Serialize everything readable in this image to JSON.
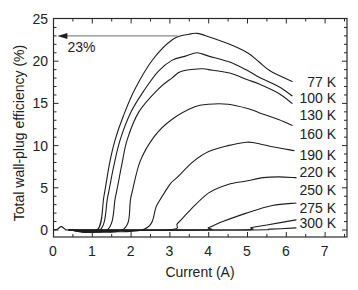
{
  "chart_data": {
    "type": "line",
    "title": "",
    "xlabel": "Current (A)",
    "ylabel": "Total wall-plug efficiency (%)",
    "xlim": [
      0,
      7.58
    ],
    "ylim": [
      -0.8,
      25
    ],
    "xticks": [
      0,
      1,
      2,
      3,
      4,
      5,
      6,
      7
    ],
    "xminor_step": 0.5,
    "yticks": [
      0,
      5,
      10,
      15,
      20,
      25
    ],
    "yminor_step": 1,
    "grid": false,
    "legend": "inline labels at right end of curves",
    "colors": {
      "line": "#1e1e1e",
      "arrow": "#8a8a8a",
      "frame": "#2a2a2a"
    },
    "series": [
      {
        "name": "77 K",
        "label_y": 17.5,
        "points": [
          [
            0.0,
            0
          ],
          [
            0.1,
            0.1
          ],
          [
            0.2,
            0.4
          ],
          [
            0.3,
            0.1
          ],
          [
            0.4,
            0
          ],
          [
            1.13,
            0
          ],
          [
            1.3,
            4.0
          ],
          [
            1.45,
            8.0
          ],
          [
            1.59,
            10.7
          ],
          [
            1.8,
            13.5
          ],
          [
            2.1,
            16.7
          ],
          [
            2.56,
            20.2
          ],
          [
            3.08,
            22.6
          ],
          [
            3.5,
            23.2
          ],
          [
            3.7,
            23.3
          ],
          [
            4.0,
            22.9
          ],
          [
            4.54,
            22.0
          ],
          [
            5.0,
            21.0
          ],
          [
            5.3,
            19.9
          ],
          [
            5.6,
            18.8
          ],
          [
            6.15,
            17.6
          ]
        ]
      },
      {
        "name": "100 K",
        "label_y": 15.6,
        "points": [
          [
            0.4,
            0
          ],
          [
            1.2,
            0
          ],
          [
            1.4,
            4.0
          ],
          [
            1.55,
            7.5
          ],
          [
            1.72,
            10.7
          ],
          [
            2.0,
            14.0
          ],
          [
            2.36,
            16.7
          ],
          [
            2.7,
            18.8
          ],
          [
            3.05,
            20.1
          ],
          [
            3.4,
            20.6
          ],
          [
            3.7,
            21.0
          ],
          [
            4.0,
            20.6
          ],
          [
            4.54,
            19.9
          ],
          [
            5.0,
            18.9
          ],
          [
            5.3,
            18.1
          ],
          [
            5.8,
            17.0
          ],
          [
            6.15,
            15.9
          ]
        ]
      },
      {
        "name": "130 K",
        "label_y": 13.6,
        "points": [
          [
            0.4,
            0
          ],
          [
            1.38,
            0
          ],
          [
            1.6,
            4.0
          ],
          [
            1.75,
            7.5
          ],
          [
            1.9,
            10.7
          ],
          [
            2.2,
            14.0
          ],
          [
            2.7,
            16.7
          ],
          [
            3.05,
            18.0
          ],
          [
            3.3,
            18.8
          ],
          [
            3.8,
            19.1
          ],
          [
            4.0,
            19.0
          ],
          [
            4.54,
            18.6
          ],
          [
            5.0,
            17.8
          ],
          [
            5.3,
            17.3
          ],
          [
            5.8,
            16.2
          ],
          [
            6.15,
            15.0
          ]
        ]
      },
      {
        "name": "160 K",
        "label_y": 11.4,
        "points": [
          [
            0.4,
            0
          ],
          [
            1.77,
            0
          ],
          [
            2.0,
            4.0
          ],
          [
            2.23,
            8.1
          ],
          [
            2.6,
            11.1
          ],
          [
            3.05,
            13.1
          ],
          [
            3.64,
            14.6
          ],
          [
            4.0,
            14.9
          ],
          [
            4.5,
            14.9
          ],
          [
            5.0,
            14.4
          ],
          [
            5.3,
            13.9
          ],
          [
            5.8,
            13.1
          ],
          [
            6.15,
            12.4
          ]
        ]
      },
      {
        "name": "190 K",
        "label_y": 8.9,
        "points": [
          [
            0.4,
            0
          ],
          [
            2.28,
            0
          ],
          [
            2.67,
            3.0
          ],
          [
            3.0,
            5.4
          ],
          [
            3.18,
            6.2
          ],
          [
            3.6,
            8.1
          ],
          [
            4.0,
            9.3
          ],
          [
            4.5,
            10.0
          ],
          [
            4.97,
            10.4
          ],
          [
            5.2,
            10.3
          ],
          [
            5.6,
            9.9
          ],
          [
            6.2,
            9.4
          ]
        ]
      },
      {
        "name": "220 K",
        "label_y": 6.9,
        "points": [
          [
            0.4,
            0
          ],
          [
            2.92,
            0
          ],
          [
            3.2,
            0.8
          ],
          [
            3.51,
            2.3
          ],
          [
            4.0,
            4.4
          ],
          [
            4.5,
            5.4
          ],
          [
            4.97,
            5.8
          ],
          [
            5.4,
            6.2
          ],
          [
            5.8,
            6.3
          ],
          [
            6.25,
            6.2
          ]
        ]
      },
      {
        "name": "250 K",
        "label_y": 4.7,
        "points": [
          [
            0.4,
            0
          ],
          [
            3.77,
            0
          ],
          [
            4.0,
            0.3
          ],
          [
            4.36,
            1.0
          ],
          [
            4.97,
            2.0
          ],
          [
            5.64,
            2.9
          ],
          [
            6.25,
            3.2
          ]
        ]
      },
      {
        "name": "275 K",
        "label_y": 2.6,
        "points": [
          [
            0.4,
            0
          ],
          [
            4.7,
            0
          ],
          [
            5.1,
            0.3
          ],
          [
            5.5,
            0.6
          ],
          [
            6.25,
            1.2
          ]
        ]
      },
      {
        "name": "300 K",
        "label_y": 0.8,
        "points": [
          [
            0.4,
            0
          ],
          [
            5.0,
            0
          ],
          [
            5.6,
            0.1
          ],
          [
            6.25,
            0.25
          ]
        ]
      }
    ],
    "annotations": [
      {
        "type": "arrow",
        "from": [
          3.2,
          23
        ],
        "to": [
          0.1,
          23
        ],
        "text": "23%",
        "text_pos": [
          0.36,
          21.7
        ]
      }
    ]
  }
}
